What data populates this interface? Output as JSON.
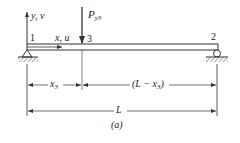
{
  "diagram": {
    "type": "simply supported beam with point load",
    "nodes": [
      {
        "id": "1",
        "label": "1",
        "support": "pin"
      },
      {
        "id": "3",
        "label": "3",
        "support": "none"
      },
      {
        "id": "2",
        "label": "2",
        "support": "roller"
      }
    ],
    "axes": {
      "y_label": "y, v",
      "x_label": "x, u"
    },
    "load": {
      "symbol": "P",
      "subscript": "y3",
      "node": "3",
      "direction": "down"
    },
    "dimensions": {
      "left_segment": {
        "symbol": "x",
        "subscript": "3"
      },
      "right_segment": {
        "prefix": "(L − x",
        "subscript": "3",
        "suffix": ")"
      },
      "total": "L"
    },
    "caption": "(a)",
    "colors": {
      "line": "#333333",
      "hatch": "#555555",
      "background": "#ffffff"
    }
  }
}
